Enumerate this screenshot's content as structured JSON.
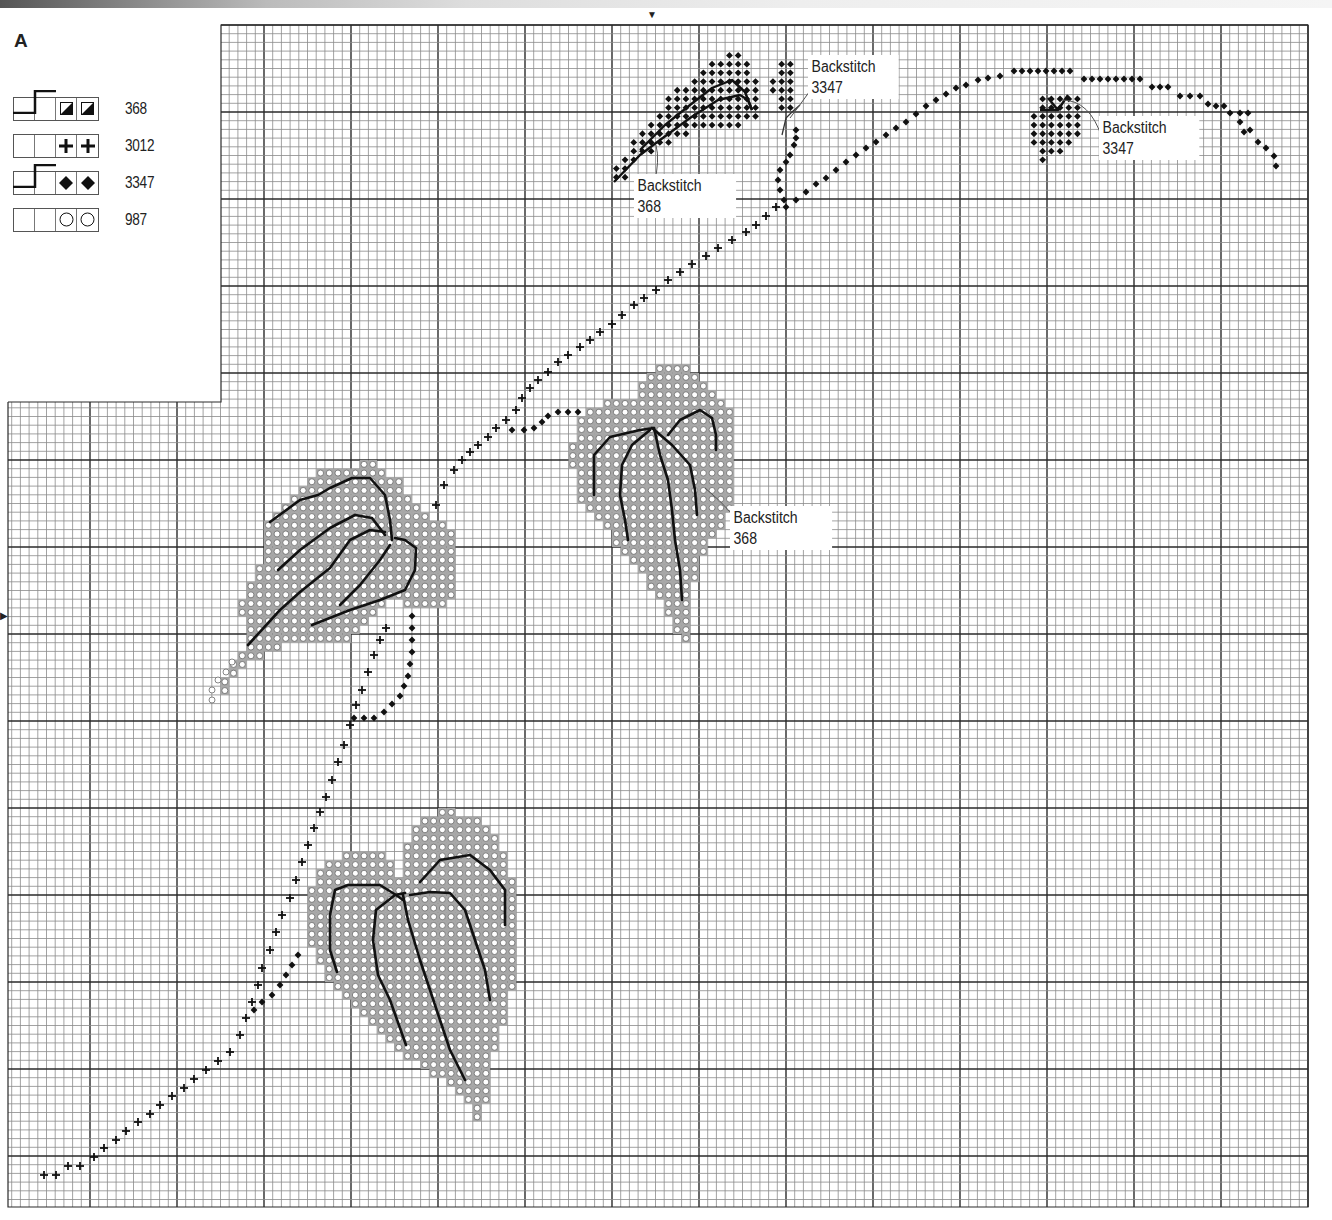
{
  "chart_title": "A",
  "key": {
    "rows": [
      {
        "symbol": "half-filled-square",
        "glyph": "◪",
        "backstitch": true,
        "number": "368"
      },
      {
        "symbol": "cross",
        "glyph": "✚",
        "backstitch": false,
        "number": "3012"
      },
      {
        "symbol": "diamond",
        "glyph": "◆",
        "backstitch": true,
        "number": "3347"
      },
      {
        "symbol": "circle",
        "glyph": "○",
        "backstitch": false,
        "number": "987"
      }
    ]
  },
  "callouts": [
    {
      "id": "bs-3347-top",
      "line1": "Backstitch",
      "line2": "3347",
      "x": 808,
      "y": 54
    },
    {
      "id": "bs-368-top",
      "line1": "Backstitch",
      "line2": "368",
      "x": 634,
      "y": 173
    },
    {
      "id": "bs-3347-right",
      "line1": "Backstitch",
      "line2": "3347",
      "x": 1099,
      "y": 115
    },
    {
      "id": "bs-368-mid",
      "line1": "Backstitch",
      "line2": "368",
      "x": 730,
      "y": 505
    }
  ],
  "markers": {
    "center_top": {
      "x": 652,
      "y": 10,
      "glyph": "▼"
    },
    "center_left": {
      "x": 0,
      "y": 612,
      "glyph": "▶"
    }
  },
  "colors": {
    "grid_thin": "#8a8a8a",
    "grid_bold": "#2a2a2a",
    "leaf_fill": "#a7a7a7",
    "symbol_dark": "#111111",
    "circle_fill": "#ffffff"
  },
  "chart_data": {
    "type": "cross-stitch-chart",
    "title": "A",
    "grid": {
      "cell_px": 8.7,
      "bold_every": 10,
      "top_section": {
        "x0": 221,
        "x1": 1308,
        "y0": 25
      },
      "left_section": {
        "x0": 8,
        "x1": 221,
        "y0": 402
      },
      "y1": 1207
    },
    "legend": [
      {
        "symbol": "half-filled-square",
        "dmc": "368",
        "backstitch": true
      },
      {
        "symbol": "cross",
        "dmc": "3012",
        "backstitch": false
      },
      {
        "symbol": "diamond",
        "dmc": "3347",
        "backstitch": true
      },
      {
        "symbol": "circle",
        "dmc": "987",
        "backstitch": false
      }
    ],
    "annotations": [
      "Backstitch 3347",
      "Backstitch 368",
      "Backstitch 3347",
      "Backstitch 368"
    ],
    "motifs": {
      "vine_cross": [
        [
          44,
          1175
        ],
        [
          56,
          1175
        ],
        [
          68,
          1166
        ],
        [
          80,
          1166
        ],
        [
          94,
          1157
        ],
        [
          104,
          1148
        ],
        [
          116,
          1140
        ],
        [
          126,
          1131
        ],
        [
          138,
          1122
        ],
        [
          150,
          1114
        ],
        [
          160,
          1105
        ],
        [
          172,
          1096
        ],
        [
          184,
          1088
        ],
        [
          194,
          1079
        ],
        [
          206,
          1070
        ],
        [
          218,
          1061
        ],
        [
          230,
          1052
        ],
        [
          240,
          1035
        ],
        [
          246,
          1018
        ],
        [
          252,
          1002
        ],
        [
          258,
          985
        ],
        [
          262,
          968
        ],
        [
          270,
          950
        ],
        [
          276,
          932
        ],
        [
          282,
          915
        ],
        [
          290,
          898
        ],
        [
          296,
          880
        ],
        [
          302,
          862
        ],
        [
          308,
          845
        ],
        [
          314,
          828
        ],
        [
          320,
          812
        ],
        [
          326,
          797
        ],
        [
          332,
          780
        ],
        [
          338,
          762
        ],
        [
          344,
          745
        ],
        [
          350,
          725
        ],
        [
          356,
          705
        ],
        [
          362,
          690
        ],
        [
          368,
          672
        ],
        [
          374,
          655
        ],
        [
          380,
          640
        ],
        [
          386,
          628
        ],
        [
          436,
          505
        ],
        [
          444,
          485
        ],
        [
          454,
          470
        ],
        [
          462,
          460
        ],
        [
          470,
          452
        ],
        [
          478,
          445
        ],
        [
          488,
          437
        ],
        [
          496,
          428
        ],
        [
          506,
          420
        ],
        [
          516,
          410
        ],
        [
          522,
          398
        ],
        [
          530,
          388
        ],
        [
          538,
          380
        ],
        [
          548,
          372
        ],
        [
          558,
          362
        ],
        [
          568,
          355
        ],
        [
          580,
          347
        ],
        [
          590,
          340
        ],
        [
          600,
          332
        ],
        [
          612,
          324
        ],
        [
          622,
          315
        ],
        [
          634,
          305
        ],
        [
          644,
          298
        ],
        [
          656,
          290
        ],
        [
          668,
          280
        ],
        [
          680,
          272
        ],
        [
          692,
          264
        ],
        [
          706,
          256
        ],
        [
          718,
          248
        ],
        [
          732,
          240
        ],
        [
          746,
          232
        ],
        [
          756,
          225
        ],
        [
          766,
          216
        ],
        [
          776,
          207
        ]
      ],
      "vine_diamond": [
        [
          254,
          1010
        ],
        [
          262,
          1002
        ],
        [
          272,
          995
        ],
        [
          280,
          985
        ],
        [
          286,
          975
        ],
        [
          292,
          965
        ],
        [
          298,
          955
        ],
        [
          354,
          718
        ],
        [
          364,
          718
        ],
        [
          374,
          718
        ],
        [
          384,
          712
        ],
        [
          392,
          704
        ],
        [
          400,
          696
        ],
        [
          404,
          686
        ],
        [
          408,
          676
        ],
        [
          410,
          664
        ],
        [
          412,
          652
        ],
        [
          412,
          640
        ],
        [
          412,
          628
        ],
        [
          412,
          616
        ],
        [
          512,
          430
        ],
        [
          524,
          430
        ],
        [
          534,
          428
        ],
        [
          542,
          422
        ],
        [
          548,
          416
        ],
        [
          558,
          412
        ],
        [
          568,
          412
        ],
        [
          578,
          412
        ],
        [
          786,
          207
        ],
        [
          796,
          200
        ],
        [
          806,
          192
        ],
        [
          816,
          184
        ],
        [
          826,
          178
        ],
        [
          836,
          170
        ],
        [
          846,
          162
        ],
        [
          856,
          155
        ],
        [
          866,
          148
        ],
        [
          876,
          142
        ],
        [
          886,
          135
        ],
        [
          896,
          128
        ],
        [
          906,
          122
        ],
        [
          916,
          114
        ],
        [
          926,
          106
        ],
        [
          936,
          100
        ],
        [
          946,
          94
        ],
        [
          956,
          88
        ],
        [
          966,
          85
        ],
        [
          978,
          80
        ],
        [
          988,
          78
        ],
        [
          1000,
          76
        ],
        [
          1014,
          71
        ],
        [
          1022,
          71
        ],
        [
          1030,
          71
        ],
        [
          1038,
          71
        ],
        [
          1046,
          71
        ],
        [
          1054,
          71
        ],
        [
          1062,
          71
        ],
        [
          1070,
          71
        ],
        [
          1084,
          79
        ],
        [
          1092,
          79
        ],
        [
          1100,
          79
        ],
        [
          1108,
          79
        ],
        [
          1116,
          79
        ],
        [
          1124,
          79
        ],
        [
          1132,
          79
        ],
        [
          1140,
          79
        ],
        [
          1152,
          87
        ],
        [
          1160,
          87
        ],
        [
          1168,
          87
        ],
        [
          1180,
          96
        ],
        [
          1190,
          96
        ],
        [
          1200,
          96
        ],
        [
          1208,
          104
        ],
        [
          1216,
          106
        ],
        [
          1224,
          106
        ],
        [
          1230,
          113
        ],
        [
          1240,
          113
        ],
        [
          1248,
          113
        ],
        [
          1240,
          122
        ],
        [
          1244,
          132
        ],
        [
          1250,
          130
        ],
        [
          1258,
          142
        ],
        [
          1266,
          148
        ],
        [
          1274,
          156
        ],
        [
          1276,
          166
        ],
        [
          784,
          200
        ],
        [
          780,
          190
        ],
        [
          778,
          180
        ],
        [
          780,
          170
        ],
        [
          786,
          162
        ],
        [
          790,
          155
        ],
        [
          794,
          145
        ],
        [
          796,
          138
        ],
        [
          796,
          130
        ]
      ],
      "leaves_circle_center": [
        [
          310,
          570
        ],
        [
          640,
          470
        ],
        [
          410,
          950
        ]
      ],
      "leaf_diamond_center": [
        [
          690,
          120
        ],
        [
          1055,
          125
        ]
      ]
    }
  }
}
